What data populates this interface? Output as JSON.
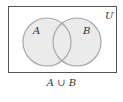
{
  "diagram": {
    "type": "venn",
    "universe_label": "U",
    "sets": [
      {
        "label": "A",
        "cx": 47,
        "cy": 42,
        "r": 24
      },
      {
        "label": "B",
        "cx": 77,
        "cy": 42,
        "r": 24
      }
    ],
    "shaded_region": "A ∪ B",
    "caption": "A ∪ B",
    "colors": {
      "fill": "#ebebeb",
      "circle_stroke": "#a8a8a8",
      "frame_stroke": "#555555",
      "text": "#333333"
    }
  }
}
